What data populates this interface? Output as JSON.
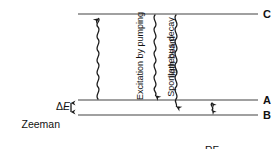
{
  "figure": {
    "type": "energy-level-diagram",
    "colors": {
      "level_line": "#808080",
      "arrow": "#1a1a1a",
      "text": "#111111",
      "background": "#ffffff"
    },
    "levels": [
      {
        "id": "C",
        "label": "C",
        "y": 14,
        "x_start": 78,
        "x_end": 258
      },
      {
        "id": "A",
        "label": "A",
        "y": 100,
        "x_start": 78,
        "x_end": 258
      },
      {
        "id": "B",
        "label": "B",
        "y": 115,
        "x_start": 78,
        "x_end": 258
      }
    ],
    "annotations": {
      "zeeman_line1": "Zeeman",
      "zeeman_line2": "sublevels",
      "delta_symbol": "Δ",
      "delta_var": "E",
      "rf_line1": "RF",
      "rf_line2": "repopulation",
      "excitation_line1": "Excitation by pumping",
      "excitation_line2": "ligth beam",
      "spontaneous_decay": "Spontaneous decay"
    },
    "transitions": [
      {
        "name": "excitation",
        "from": "A",
        "to": "C",
        "x": 98,
        "direction": "up",
        "style": "wavy"
      },
      {
        "name": "spontaneous-decay-to-A",
        "from": "C",
        "to": "A",
        "x": 155,
        "direction": "down",
        "style": "wavy"
      },
      {
        "name": "spontaneous-decay-to-B",
        "from": "C",
        "to": "B",
        "x": 176,
        "direction": "down",
        "style": "wavy"
      },
      {
        "name": "rf-repopulation",
        "from": "B",
        "to": "A",
        "x": 212,
        "direction": "both",
        "style": "wavy"
      },
      {
        "name": "delta-E-gap",
        "from": "B",
        "to": "A",
        "x": 71,
        "direction": "both",
        "style": "straight"
      }
    ]
  }
}
